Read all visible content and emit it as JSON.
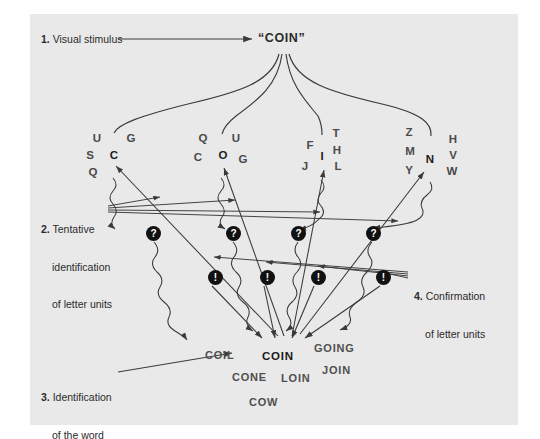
{
  "figure": {
    "background_color": "#e9e9e9",
    "ink_color": "#2b2b2b",
    "node_color": "#111111"
  },
  "steps": [
    {
      "num": "1.",
      "line1": "Visual stimulus",
      "line2": "",
      "line3": ""
    },
    {
      "num": "2.",
      "line1": "Tentative",
      "line2": "identification",
      "line3": "of letter units"
    },
    {
      "num": "3.",
      "line1": "Identification",
      "line2": "of the word",
      "line3": ""
    },
    {
      "num": "4.",
      "line1": "Confirmation",
      "line2": "of letter units",
      "line3": ""
    }
  ],
  "stimulus": {
    "text": "“COIN”"
  },
  "letter_clusters": [
    {
      "focal": "C",
      "letters": [
        {
          "ch": "U",
          "x": 97,
          "y": 139
        },
        {
          "ch": "G",
          "x": 131,
          "y": 139
        },
        {
          "ch": "S",
          "x": 90,
          "y": 156
        },
        {
          "ch": "C",
          "x": 114,
          "y": 156,
          "focal": true
        },
        {
          "ch": "Q",
          "x": 93,
          "y": 173
        }
      ]
    },
    {
      "focal": "O",
      "letters": [
        {
          "ch": "Q",
          "x": 203,
          "y": 139
        },
        {
          "ch": "U",
          "x": 236,
          "y": 139
        },
        {
          "ch": "C",
          "x": 198,
          "y": 158
        },
        {
          "ch": "O",
          "x": 223,
          "y": 156,
          "focal": true
        },
        {
          "ch": "G",
          "x": 243,
          "y": 160
        }
      ]
    },
    {
      "focal": "I",
      "letters": [
        {
          "ch": "T",
          "x": 336,
          "y": 134
        },
        {
          "ch": "F",
          "x": 310,
          "y": 146
        },
        {
          "ch": "H",
          "x": 337,
          "y": 151
        },
        {
          "ch": "I",
          "x": 322,
          "y": 157,
          "focal": true
        },
        {
          "ch": "J",
          "x": 305,
          "y": 167
        },
        {
          "ch": "L",
          "x": 338,
          "y": 167
        }
      ]
    },
    {
      "focal": "N",
      "letters": [
        {
          "ch": "Z",
          "x": 409,
          "y": 133
        },
        {
          "ch": "H",
          "x": 453,
          "y": 140
        },
        {
          "ch": "M",
          "x": 410,
          "y": 152
        },
        {
          "ch": "V",
          "x": 453,
          "y": 156
        },
        {
          "ch": "N",
          "x": 430,
          "y": 160,
          "focal": true
        },
        {
          "ch": "Y",
          "x": 409,
          "y": 171
        },
        {
          "ch": "W",
          "x": 452,
          "y": 172
        }
      ]
    }
  ],
  "tentative_nodes": [
    {
      "glyph": "?",
      "x": 146,
      "y": 226
    },
    {
      "glyph": "?",
      "x": 226,
      "y": 226
    },
    {
      "glyph": "?",
      "x": 291,
      "y": 226
    },
    {
      "glyph": "?",
      "x": 366,
      "y": 226
    }
  ],
  "confirmation_nodes": [
    {
      "glyph": "!",
      "x": 208,
      "y": 270
    },
    {
      "glyph": "!",
      "x": 260,
      "y": 270
    },
    {
      "glyph": "!",
      "x": 311,
      "y": 270
    },
    {
      "glyph": "!",
      "x": 376,
      "y": 270
    }
  ],
  "word_candidates": [
    {
      "text": "COIL",
      "x": 205,
      "y": 349,
      "focal": false
    },
    {
      "text": "COIN",
      "x": 262,
      "y": 350,
      "focal": true
    },
    {
      "text": "GOING",
      "x": 314,
      "y": 342,
      "focal": false
    },
    {
      "text": "JOIN",
      "x": 322,
      "y": 364,
      "focal": false
    },
    {
      "text": "CONE",
      "x": 232,
      "y": 371,
      "focal": false
    },
    {
      "text": "LOIN",
      "x": 281,
      "y": 372,
      "focal": false
    },
    {
      "text": "COW",
      "x": 249,
      "y": 396,
      "focal": false
    }
  ]
}
